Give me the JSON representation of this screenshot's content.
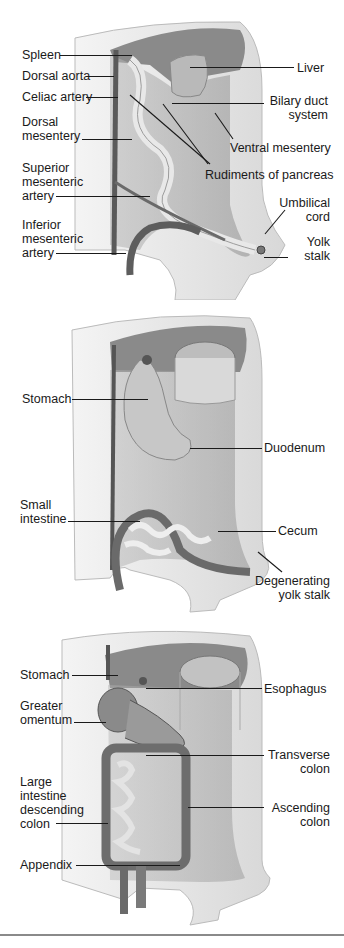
{
  "figure": {
    "panels": [
      {
        "id": "stage-1",
        "labels": {
          "spleen": "Spleen",
          "dorsal_aorta": "Dorsal aorta",
          "celiac_artery": "Celiac artery",
          "dorsal_mesentery_1": "Dorsal",
          "dorsal_mesentery_2": "mesentery",
          "superior_mesenteric_1": "Superior",
          "superior_mesenteric_2": "mesenteric",
          "superior_mesenteric_3": "artery",
          "inferior_mesenteric_1": "Inferior",
          "inferior_mesenteric_2": "mesenteric",
          "inferior_mesenteric_3": "artery",
          "liver": "Liver",
          "bilary_duct_1": "Bilary duct",
          "bilary_duct_2": "system",
          "ventral_mesentery": "Ventral mesentery",
          "rudiments_pancreas": "Rudiments of pancreas",
          "umbilical_cord_1": "Umbilical",
          "umbilical_cord_2": "cord",
          "yolk_stalk_1": "Yolk",
          "yolk_stalk_2": "stalk"
        }
      },
      {
        "id": "stage-2",
        "labels": {
          "stomach": "Stomach",
          "duodenum": "Duodenum",
          "small_intestine_1": "Small",
          "small_intestine_2": "intestine",
          "cecum": "Cecum",
          "degenerating_1": "Degenerating",
          "degenerating_2": "yolk stalk"
        }
      },
      {
        "id": "stage-3",
        "labels": {
          "stomach": "Stomach",
          "esophagus": "Esophagus",
          "greater_omentum_1": "Greater",
          "greater_omentum_2": "omentum",
          "transverse_colon_1": "Transverse",
          "transverse_colon_2": "colon",
          "large_intestine_1": "Large",
          "large_intestine_2": "intestine",
          "large_intestine_3": "descending",
          "large_intestine_4": "colon",
          "ascending_colon_1": "Ascending",
          "ascending_colon_2": "colon",
          "appendix": "Appendix"
        }
      }
    ],
    "colors": {
      "wall_light": "#ececec",
      "wall_mid": "#cfcfcf",
      "cavity": "#9a9a9a",
      "vessel": "#555555",
      "text": "#1a1a1a"
    }
  }
}
